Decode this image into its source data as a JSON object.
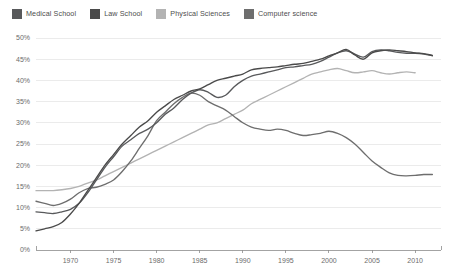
{
  "chart_data": {
    "type": "line",
    "title": "",
    "subtitle": "",
    "xlabel": "",
    "ylabel": "",
    "xlim": [
      1966,
      2013
    ],
    "ylim": [
      0,
      50
    ],
    "y_tick_suffix": "%",
    "grid": true,
    "legend_position": "top-left",
    "x_ticks": [
      1970,
      1975,
      1980,
      1985,
      1990,
      1995,
      2000,
      2005,
      2010
    ],
    "y_ticks": [
      0,
      5,
      10,
      15,
      20,
      25,
      30,
      35,
      40,
      45,
      50
    ],
    "y_tick_labels": [
      "0%",
      "5%",
      "10%",
      "15%",
      "20%",
      "25%",
      "30%",
      "35%",
      "40%",
      "45%",
      "50%"
    ],
    "x_tick_labels": [
      "1970",
      "1975",
      "1980",
      "1985",
      "1990",
      "1995",
      "2000",
      "2005",
      "2010"
    ],
    "series": [
      {
        "name": "Medical School",
        "color": "#58595b",
        "x": [
          1966,
          1967,
          1968,
          1969,
          1970,
          1971,
          1972,
          1973,
          1974,
          1975,
          1976,
          1977,
          1978,
          1979,
          1980,
          1981,
          1982,
          1983,
          1984,
          1985,
          1986,
          1987,
          1988,
          1989,
          1990,
          1991,
          1992,
          1993,
          1994,
          1995,
          1996,
          1997,
          1998,
          1999,
          2000,
          2001,
          2002,
          2003,
          2004,
          2005,
          2006,
          2007,
          2008,
          2009,
          2010,
          2011,
          2012
        ],
        "values": [
          9.0,
          8.8,
          8.6,
          9.0,
          9.6,
          11.0,
          13.5,
          16.5,
          19.5,
          22.0,
          24.5,
          26.0,
          27.5,
          28.5,
          30.0,
          32.0,
          33.5,
          35.5,
          37.0,
          37.8,
          37.2,
          36.0,
          36.5,
          38.5,
          40.0,
          41.0,
          41.5,
          42.0,
          42.5,
          43.0,
          43.2,
          43.5,
          43.8,
          44.5,
          45.5,
          46.5,
          47.0,
          46.2,
          45.5,
          46.8,
          47.2,
          47.0,
          46.6,
          46.4,
          46.4,
          46.2,
          45.8
        ]
      },
      {
        "name": "Law School",
        "color": "#4a4a4a",
        "x": [
          1966,
          1967,
          1968,
          1969,
          1970,
          1971,
          1972,
          1973,
          1974,
          1975,
          1976,
          1977,
          1978,
          1979,
          1980,
          1981,
          1982,
          1983,
          1984,
          1985,
          1986,
          1987,
          1988,
          1989,
          1990,
          1991,
          1992,
          1993,
          1994,
          1995,
          1996,
          1997,
          1998,
          1999,
          2000,
          2001,
          2002,
          2003,
          2004,
          2005,
          2006,
          2007,
          2008,
          2009,
          2010,
          2011,
          2012
        ],
        "values": [
          4.5,
          5.0,
          5.5,
          6.5,
          8.5,
          11.0,
          14.0,
          17.0,
          20.0,
          22.5,
          25.0,
          27.0,
          29.0,
          30.5,
          32.5,
          34.0,
          35.5,
          36.5,
          37.5,
          38.0,
          39.0,
          40.0,
          40.5,
          41.0,
          41.5,
          42.5,
          42.8,
          43.0,
          43.2,
          43.5,
          43.8,
          44.0,
          44.5,
          45.0,
          45.8,
          46.5,
          47.3,
          46.0,
          45.0,
          46.5,
          47.0,
          47.2,
          47.0,
          46.8,
          46.5,
          46.3,
          45.9
        ]
      },
      {
        "name": "Physical Sciences",
        "color": "#b3b3b3",
        "x": [
          1966,
          1967,
          1968,
          1969,
          1970,
          1971,
          1972,
          1973,
          1974,
          1975,
          1976,
          1977,
          1978,
          1979,
          1980,
          1981,
          1982,
          1983,
          1984,
          1985,
          1986,
          1987,
          1988,
          1989,
          1990,
          1991,
          1992,
          1993,
          1994,
          1995,
          1996,
          1997,
          1998,
          1999,
          2000,
          2001,
          2002,
          2003,
          2004,
          2005,
          2006,
          2007,
          2008,
          2009,
          2010
        ],
        "values": [
          14.0,
          14.0,
          14.0,
          14.2,
          14.5,
          15.0,
          15.8,
          16.5,
          17.5,
          18.5,
          19.5,
          20.5,
          21.5,
          22.5,
          23.5,
          24.5,
          25.5,
          26.5,
          27.5,
          28.5,
          29.5,
          30.0,
          31.0,
          32.0,
          33.0,
          34.5,
          35.5,
          36.5,
          37.5,
          38.5,
          39.5,
          40.5,
          41.5,
          42.0,
          42.5,
          42.8,
          42.3,
          41.8,
          42.0,
          42.3,
          41.8,
          41.5,
          41.8,
          42.0,
          41.8
        ]
      },
      {
        "name": "Computer science",
        "color": "#6e6e6e",
        "x": [
          1966,
          1967,
          1968,
          1969,
          1970,
          1971,
          1972,
          1973,
          1974,
          1975,
          1976,
          1977,
          1978,
          1979,
          1980,
          1981,
          1982,
          1983,
          1984,
          1985,
          1986,
          1987,
          1988,
          1989,
          1990,
          1991,
          1992,
          1993,
          1994,
          1995,
          1996,
          1997,
          1998,
          1999,
          2000,
          2001,
          2002,
          2003,
          2004,
          2005,
          2006,
          2007,
          2008,
          2009,
          2010,
          2011,
          2012
        ],
        "values": [
          11.5,
          11.0,
          10.5,
          11.0,
          12.0,
          13.5,
          14.5,
          14.8,
          15.5,
          16.5,
          18.5,
          21.0,
          24.0,
          27.0,
          30.5,
          32.5,
          34.5,
          36.0,
          37.0,
          36.5,
          35.0,
          34.0,
          33.0,
          31.5,
          30.0,
          29.0,
          28.5,
          28.2,
          28.5,
          28.2,
          27.5,
          27.0,
          27.2,
          27.5,
          28.0,
          27.5,
          26.5,
          25.0,
          23.0,
          21.0,
          19.5,
          18.2,
          17.6,
          17.5,
          17.6,
          17.8,
          17.8
        ]
      }
    ]
  },
  "legend": {
    "items": [
      {
        "label": "Medical School",
        "color": "#58595b"
      },
      {
        "label": "Law School",
        "color": "#4a4a4a"
      },
      {
        "label": "Physical Sciences",
        "color": "#b3b3b3"
      },
      {
        "label": "Computer science",
        "color": "#6e6e6e"
      }
    ]
  }
}
